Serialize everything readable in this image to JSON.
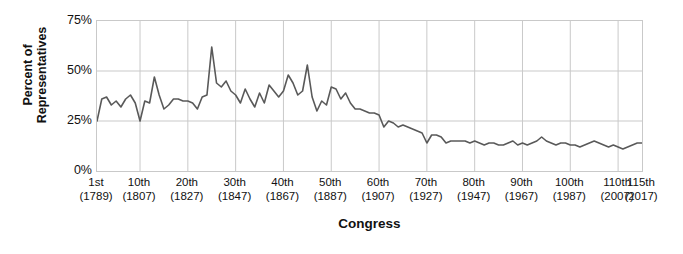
{
  "chart_data": {
    "type": "line",
    "title": "",
    "xlabel": "Congress",
    "ylabel": "Percent of\nRepresentatives",
    "ylim": [
      0,
      75
    ],
    "xlim": [
      1,
      115
    ],
    "grid": true,
    "legend": null,
    "line_color": "#595959",
    "grid_color": "#c9c9c9",
    "y_ticks": [
      {
        "value": 75,
        "label": "75%"
      },
      {
        "value": 50,
        "label": "50%"
      },
      {
        "value": 25,
        "label": "25%"
      },
      {
        "value": 0,
        "label": "0%"
      }
    ],
    "x_ticks": [
      {
        "value": 1,
        "congress": "1st",
        "year": "(1789)"
      },
      {
        "value": 10,
        "congress": "10th",
        "year": "(1807)"
      },
      {
        "value": 20,
        "congress": "20th",
        "year": "(1827)"
      },
      {
        "value": 30,
        "congress": "30th",
        "year": "(1847)"
      },
      {
        "value": 40,
        "congress": "40th",
        "year": "(1867)"
      },
      {
        "value": 50,
        "congress": "50th",
        "year": "(1887)"
      },
      {
        "value": 60,
        "congress": "60th",
        "year": "(1907)"
      },
      {
        "value": 70,
        "congress": "70th",
        "year": "(1927)"
      },
      {
        "value": 80,
        "congress": "80th",
        "year": "(1947)"
      },
      {
        "value": 90,
        "congress": "90th",
        "year": "(1967)"
      },
      {
        "value": 100,
        "congress": "100th",
        "year": "(1987)"
      },
      {
        "value": 110,
        "congress": "110th",
        "year": "(2007)"
      },
      {
        "value": 115,
        "congress": "115th",
        "year": "(2017)"
      }
    ],
    "x": [
      1,
      2,
      3,
      4,
      5,
      6,
      7,
      8,
      9,
      10,
      11,
      12,
      13,
      14,
      15,
      16,
      17,
      18,
      19,
      20,
      21,
      22,
      23,
      24,
      25,
      26,
      27,
      28,
      29,
      30,
      31,
      32,
      33,
      34,
      35,
      36,
      37,
      38,
      39,
      40,
      41,
      42,
      43,
      44,
      45,
      46,
      47,
      48,
      49,
      50,
      51,
      52,
      53,
      54,
      55,
      56,
      57,
      58,
      59,
      60,
      61,
      62,
      63,
      64,
      65,
      66,
      67,
      68,
      69,
      70,
      71,
      72,
      73,
      74,
      75,
      76,
      77,
      78,
      79,
      80,
      81,
      82,
      83,
      84,
      85,
      86,
      87,
      88,
      89,
      90,
      91,
      92,
      93,
      94,
      95,
      96,
      97,
      98,
      99,
      100,
      101,
      102,
      103,
      104,
      105,
      106,
      107,
      108,
      109,
      110,
      111,
      112,
      113,
      114,
      115
    ],
    "y": [
      25,
      36,
      37,
      33,
      35,
      32,
      36,
      38,
      34,
      25,
      35,
      34,
      47,
      38,
      31,
      33,
      36,
      36,
      35,
      35,
      34,
      31,
      37,
      38,
      62,
      44,
      42,
      45,
      40,
      38,
      34,
      41,
      36,
      32,
      39,
      34,
      43,
      40,
      37,
      40,
      48,
      44,
      38,
      40,
      53,
      37,
      30,
      35,
      33,
      42,
      41,
      36,
      39,
      34,
      31,
      31,
      30,
      29,
      29,
      28,
      22,
      25,
      24,
      22,
      23,
      22,
      21,
      20,
      19,
      14,
      18,
      18,
      17,
      14,
      15,
      15,
      15,
      15,
      14,
      15,
      14,
      13,
      14,
      14,
      13,
      13,
      14,
      15,
      13,
      14,
      13,
      14,
      15,
      17,
      15,
      14,
      13,
      14,
      14,
      13,
      13,
      12,
      13,
      14,
      15,
      14,
      13,
      12,
      13,
      12,
      11,
      12,
      13,
      14,
      14
    ],
    "series_name": "Percent of Representatives"
  }
}
